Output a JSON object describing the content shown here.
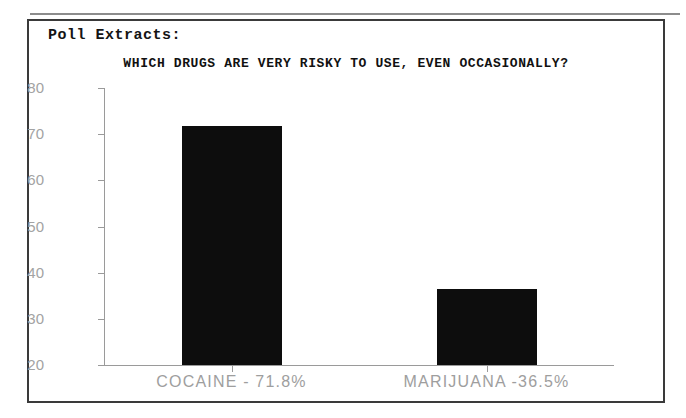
{
  "figure": {
    "section_heading": "Poll Extracts:"
  },
  "chart_data": {
    "type": "bar",
    "title": "WHICH DRUGS ARE VERY RISKY TO USE, EVEN OCCASIONALLY?",
    "xlabel": "",
    "ylabel": "",
    "categories": [
      "COCAINE",
      "MARIJUANA"
    ],
    "category_labels": [
      "COCAINE - 71.8%",
      "MARIJUANA -36.5%"
    ],
    "values": [
      71.8,
      36.5
    ],
    "value_labels": [
      "71.8%",
      "36.5%"
    ],
    "ylim": [
      20,
      80
    ],
    "yticks": [
      80,
      70,
      60,
      50,
      40,
      30,
      20
    ],
    "ytick_labels": [
      "80",
      "70",
      "60",
      "50",
      "40",
      "30",
      "20"
    ],
    "grid": false,
    "legend": "none",
    "bar_color": "#0d0d0d",
    "axis_color": "#9a9a9a",
    "tick_label_color": "#a3a3a3"
  }
}
